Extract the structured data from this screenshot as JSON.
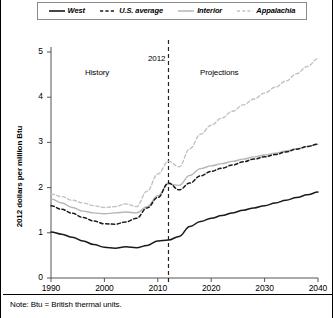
{
  "figure": {
    "note": "Note: Btu = British thermal units.",
    "y_axis_title": "2012 dollars per million Btu"
  },
  "annotations": {
    "history": "History",
    "divider_year": "2012",
    "projections": "Projections"
  },
  "legend": {
    "entries": [
      {
        "label": "West",
        "style": "solid",
        "color": "#1a1a1a"
      },
      {
        "label": "U.S. average",
        "style": "dashed",
        "color": "#1a1a1a"
      },
      {
        "label": "Interior",
        "style": "solid",
        "color": "#b6b6b6"
      },
      {
        "label": "Appalachia",
        "style": "dashed",
        "color": "#c2c2c2"
      }
    ]
  },
  "chart_data": {
    "type": "line",
    "title": "",
    "subtitle": "",
    "xlabel": "",
    "ylabel": "2012 dollars per million Btu",
    "xlim": [
      1990,
      2040
    ],
    "ylim": [
      0,
      5
    ],
    "xticks": [
      1990,
      2000,
      2010,
      2020,
      2030,
      2040
    ],
    "yticks": [
      0,
      1,
      2,
      3,
      4,
      5
    ],
    "grid": false,
    "legend_position": "top",
    "history_projection_divider": 2012,
    "x": [
      1990,
      1992,
      1994,
      1996,
      1998,
      2000,
      2002,
      2004,
      2006,
      2008,
      2010,
      2012,
      2014,
      2016,
      2018,
      2020,
      2022,
      2024,
      2026,
      2028,
      2030,
      2032,
      2034,
      2036,
      2038,
      2040
    ],
    "series": [
      {
        "name": "West",
        "color": "#1a1a1a",
        "style": "solid",
        "values": [
          1.02,
          0.97,
          0.9,
          0.82,
          0.74,
          0.68,
          0.66,
          0.69,
          0.67,
          0.72,
          0.82,
          0.84,
          0.92,
          1.14,
          1.25,
          1.32,
          1.38,
          1.44,
          1.5,
          1.55,
          1.6,
          1.66,
          1.72,
          1.78,
          1.84,
          1.9
        ]
      },
      {
        "name": "U.S. average",
        "color": "#1a1a1a",
        "style": "dashed",
        "values": [
          1.6,
          1.52,
          1.43,
          1.34,
          1.26,
          1.2,
          1.19,
          1.24,
          1.32,
          1.55,
          1.78,
          2.1,
          1.95,
          2.1,
          2.26,
          2.36,
          2.43,
          2.5,
          2.57,
          2.63,
          2.68,
          2.73,
          2.79,
          2.85,
          2.91,
          2.96
        ]
      },
      {
        "name": "Interior",
        "color": "#b6b6b6",
        "style": "solid",
        "values": [
          1.75,
          1.66,
          1.56,
          1.48,
          1.44,
          1.42,
          1.44,
          1.46,
          1.44,
          1.58,
          1.82,
          2.08,
          2.05,
          2.27,
          2.42,
          2.48,
          2.53,
          2.58,
          2.63,
          2.68,
          2.72,
          2.76,
          2.81,
          2.86,
          2.91,
          2.96
        ]
      },
      {
        "name": "Appalachia",
        "color": "#c2c2c2",
        "style": "dashed",
        "values": [
          1.86,
          1.8,
          1.72,
          1.66,
          1.6,
          1.56,
          1.58,
          1.64,
          1.58,
          1.92,
          2.3,
          2.58,
          2.46,
          2.86,
          3.18,
          3.38,
          3.54,
          3.69,
          3.83,
          3.96,
          4.09,
          4.22,
          4.36,
          4.52,
          4.68,
          4.85
        ]
      }
    ]
  }
}
